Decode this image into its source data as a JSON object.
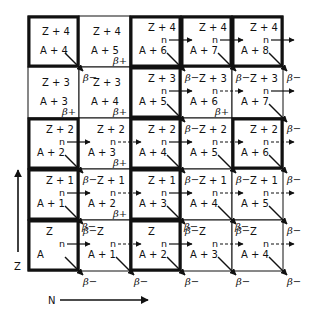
{
  "diagram": {
    "title": "",
    "axis_z_label": "Z",
    "axis_n_label": "N",
    "neutron_symbol": "n",
    "beta_minus": "β−",
    "beta_plus": "β+",
    "grid": {
      "x0": 28,
      "y0": 16,
      "cell": 51,
      "cols": 5,
      "rows": 5
    },
    "rows": [
      {
        "z": "Z + 4",
        "cells": [
          {
            "z": "Z + 4",
            "a": "A + 4",
            "bold": true,
            "n": false,
            "n_dashed": false,
            "beta_minus_in": false,
            "beta_plus": false,
            "beta_minus_out": true
          },
          {
            "z": "Z + 4",
            "a": "A + 5",
            "bold": false,
            "n": false,
            "n_dashed": false,
            "beta_minus_in": false,
            "beta_plus": true,
            "beta_minus_out": false
          },
          {
            "z": "Z + 4",
            "a": "A + 6",
            "bold": true,
            "n": true,
            "n_dashed": false,
            "beta_minus_in": false,
            "beta_plus": false,
            "beta_minus_out": true
          },
          {
            "z": "Z + 4",
            "a": "A + 7",
            "bold": true,
            "n": true,
            "n_dashed": false,
            "beta_minus_in": false,
            "beta_plus": false,
            "beta_minus_out": true
          },
          {
            "z": "Z + 4",
            "a": "A + 8",
            "bold": true,
            "n": true,
            "n_dashed": false,
            "beta_minus_in": false,
            "beta_plus": false,
            "beta_minus_out": true
          }
        ]
      },
      {
        "z": "Z + 3",
        "cells": [
          {
            "z": "Z + 3",
            "a": "A + 3",
            "bold": false,
            "n": false,
            "n_dashed": false,
            "beta_minus_in": false,
            "beta_plus": true,
            "beta_minus_out": false
          },
          {
            "z": "Z + 3",
            "a": "A + 4",
            "bold": false,
            "n": false,
            "n_dashed": false,
            "beta_minus_in": true,
            "beta_plus": true,
            "beta_minus_out": false
          },
          {
            "z": "Z + 3",
            "a": "A + 5",
            "bold": true,
            "n": true,
            "n_dashed": false,
            "beta_minus_in": false,
            "beta_plus": false,
            "beta_minus_out": true
          },
          {
            "z": "Z + 3",
            "a": "A + 6",
            "bold": false,
            "n": true,
            "n_dashed": true,
            "beta_minus_in": true,
            "beta_plus": true,
            "beta_minus_out": false
          },
          {
            "z": "Z + 3",
            "a": "A + 7",
            "bold": false,
            "n": true,
            "n_dashed": false,
            "beta_minus_in": true,
            "beta_plus": false,
            "beta_minus_out": true
          }
        ]
      },
      {
        "z": "Z + 2",
        "cells": [
          {
            "z": "Z + 2",
            "a": "A + 2",
            "bold": true,
            "n": true,
            "n_dashed": false,
            "beta_minus_in": false,
            "beta_plus": false,
            "beta_minus_out": true
          },
          {
            "z": "Z + 2",
            "a": "A + 3",
            "bold": false,
            "n": true,
            "n_dashed": true,
            "beta_minus_in": false,
            "beta_plus": true,
            "beta_minus_out": false
          },
          {
            "z": "Z + 2",
            "a": "A + 4",
            "bold": true,
            "n": true,
            "n_dashed": false,
            "beta_minus_in": false,
            "beta_plus": false,
            "beta_minus_out": true
          },
          {
            "z": "Z + 2",
            "a": "A + 5",
            "bold": false,
            "n": true,
            "n_dashed": true,
            "beta_minus_in": true,
            "beta_plus": false,
            "beta_minus_out": true
          },
          {
            "z": "Z + 2",
            "a": "A + 6",
            "bold": true,
            "n": true,
            "n_dashed": true,
            "beta_minus_in": false,
            "beta_plus": false,
            "beta_minus_out": true
          }
        ]
      },
      {
        "z": "Z + 1",
        "cells": [
          {
            "z": "Z + 1",
            "a": "A + 1",
            "bold": true,
            "n": true,
            "n_dashed": false,
            "beta_minus_in": false,
            "beta_plus": false,
            "beta_minus_out": true
          },
          {
            "z": "Z + 1",
            "a": "A + 2",
            "bold": false,
            "n": true,
            "n_dashed": true,
            "beta_minus_in": true,
            "beta_plus": true,
            "beta_minus_out": false
          },
          {
            "z": "Z + 1",
            "a": "A + 3",
            "bold": true,
            "n": true,
            "n_dashed": false,
            "beta_minus_in": false,
            "beta_plus": false,
            "beta_minus_out": true
          },
          {
            "z": "Z + 1",
            "a": "A + 4",
            "bold": false,
            "n": true,
            "n_dashed": true,
            "beta_minus_in": true,
            "beta_plus": false,
            "beta_minus_out": true
          },
          {
            "z": "Z + 1",
            "a": "A + 5",
            "bold": false,
            "n": true,
            "n_dashed": true,
            "beta_minus_in": true,
            "beta_plus": false,
            "beta_minus_out": true
          }
        ]
      },
      {
        "z": "Z",
        "cells": [
          {
            "z": "Z",
            "a": "A",
            "bold": true,
            "n": true,
            "n_dashed": false,
            "beta_minus_in": false,
            "beta_plus": false,
            "beta_minus_out": true
          },
          {
            "z": "Z",
            "a": "A + 1",
            "bold": false,
            "n": true,
            "n_dashed": true,
            "beta_minus_in": true,
            "beta_plus": false,
            "beta_minus_out": true
          },
          {
            "z": "Z",
            "a": "A + 2",
            "bold": true,
            "n": true,
            "n_dashed": false,
            "beta_minus_in": false,
            "beta_plus": false,
            "beta_minus_out": true
          },
          {
            "z": "Z",
            "a": "A + 3",
            "bold": false,
            "n": true,
            "n_dashed": true,
            "beta_minus_in": true,
            "beta_plus": false,
            "beta_minus_out": true
          },
          {
            "z": "Z",
            "a": "A + 4",
            "bold": false,
            "n": true,
            "n_dashed": true,
            "beta_minus_in": true,
            "beta_plus": false,
            "beta_minus_out": true
          }
        ]
      }
    ]
  }
}
